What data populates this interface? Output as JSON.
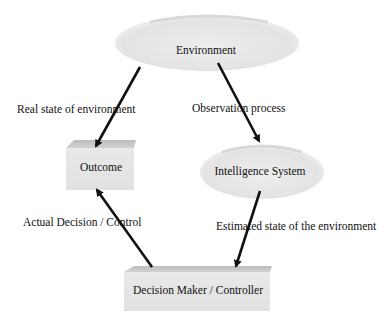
{
  "diagram": {
    "nodes": [
      {
        "id": "environment",
        "label": "Environment",
        "shape": "ellipse"
      },
      {
        "id": "outcome",
        "label": "Outcome",
        "shape": "3d-box"
      },
      {
        "id": "intelligence_system",
        "label": "Intelligence System",
        "shape": "ellipse"
      },
      {
        "id": "decision_maker",
        "label": "Decision Maker / Controller",
        "shape": "3d-box"
      }
    ],
    "edges": [
      {
        "from": "environment",
        "to": "outcome",
        "label": "Real state of environment"
      },
      {
        "from": "environment",
        "to": "intelligence_system",
        "label": "Observation process"
      },
      {
        "from": "intelligence_system",
        "to": "decision_maker",
        "label": "Estimated state of the environment"
      },
      {
        "from": "decision_maker",
        "to": "outcome",
        "label": "Actual Decision / Control"
      }
    ]
  },
  "colors": {
    "node_fill": "#e6e6e6",
    "node_shade": "#cfcfcf",
    "arrow": "#111111",
    "text": "#111111"
  }
}
